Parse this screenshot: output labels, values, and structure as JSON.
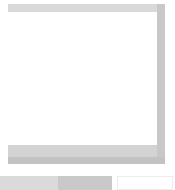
{
  "frame": {
    "colors": {
      "top_bar": "#d9d9d9",
      "right_bar": "#c8c8c8",
      "bottom_bar_light": "#d3d3d3",
      "bottom_bar_dark": "#c2c2c2",
      "panel_background": "#ffffff"
    }
  },
  "bottom_controls": {
    "segments": [
      {
        "color": "#dadada"
      },
      {
        "color": "#c9c9c9"
      },
      {
        "color": "#ffffff"
      }
    ]
  }
}
